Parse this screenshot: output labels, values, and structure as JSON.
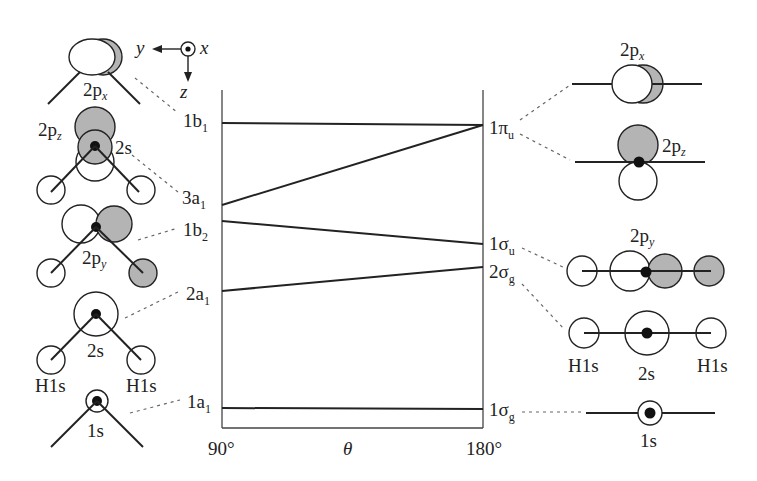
{
  "diagram": {
    "type": "Walsh correlation diagram (AH2 bent vs linear)",
    "axis": {
      "left_label": "90°",
      "center_label": "θ",
      "right_label": "180°"
    },
    "coordinate_system": {
      "axes": [
        "y",
        "x",
        "z"
      ]
    },
    "left_levels": [
      {
        "main": "1b",
        "sub": "1",
        "orbital_label": "2p",
        "orbital_sub": "x"
      },
      {
        "main": "3a",
        "sub": "1",
        "orbital_label": "2p",
        "orbital_sub": "z",
        "extra_label": "2s"
      },
      {
        "main": "1b",
        "sub": "2",
        "orbital_label": "2p",
        "orbital_sub": "y"
      },
      {
        "main": "2a",
        "sub": "1",
        "orbital_label": "2s",
        "h_labels": [
          "H1s",
          "H1s"
        ]
      },
      {
        "main": "1a",
        "sub": "1",
        "orbital_label": "1s"
      }
    ],
    "right_levels": [
      {
        "main": "1π",
        "sub": "u",
        "orbital_labels": [
          {
            "main": "2p",
            "sub": "x"
          },
          {
            "main": "2p",
            "sub": "z"
          }
        ]
      },
      {
        "main": "1σ",
        "sub": "u",
        "orbital_label": "2p",
        "orbital_sub": "y"
      },
      {
        "main": "2σ",
        "sub": "g",
        "orbital_label": "2s",
        "h_labels": [
          "H1s",
          "H1s"
        ]
      },
      {
        "main": "1σ",
        "sub": "g",
        "orbital_label": "1s"
      }
    ],
    "correlations": [
      {
        "from": "1b1",
        "to": "1πu"
      },
      {
        "from": "3a1",
        "to": "1πu"
      },
      {
        "from": "1b2",
        "to": "1σu"
      },
      {
        "from": "2a1",
        "to": "2σg"
      },
      {
        "from": "1a1",
        "to": "1σg"
      }
    ]
  }
}
